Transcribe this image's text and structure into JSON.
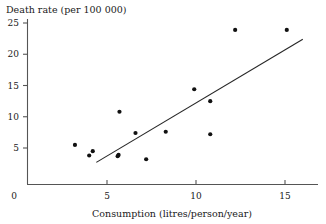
{
  "chart_data": {
    "type": "scatter",
    "title": "",
    "ylabel": "Death rate (per 100 000)",
    "xlabel": "Consumption (litres/person/year)",
    "xlim": [
      0,
      16.2
    ],
    "ylim": [
      0,
      26.5
    ],
    "xticks": [
      0,
      5,
      10,
      15
    ],
    "xtick_labels": [
      "0",
      "5",
      "10",
      "15"
    ],
    "yticks": [
      5,
      10,
      15,
      20,
      25
    ],
    "ytick_labels": [
      "5",
      "10",
      "15",
      "20",
      "25"
    ],
    "origin_label": "0",
    "grid": false,
    "legend": null,
    "points": [
      {
        "x": 3.2,
        "y": 5.5
      },
      {
        "x": 4.0,
        "y": 3.8
      },
      {
        "x": 4.2,
        "y": 4.5
      },
      {
        "x": 5.6,
        "y": 3.7
      },
      {
        "x": 5.65,
        "y": 3.9
      },
      {
        "x": 5.7,
        "y": 10.8
      },
      {
        "x": 6.6,
        "y": 7.4
      },
      {
        "x": 7.2,
        "y": 3.2
      },
      {
        "x": 8.3,
        "y": 7.6
      },
      {
        "x": 9.9,
        "y": 14.4
      },
      {
        "x": 10.8,
        "y": 12.5
      },
      {
        "x": 10.8,
        "y": 7.2
      },
      {
        "x": 12.2,
        "y": 23.9
      },
      {
        "x": 15.1,
        "y": 23.9
      }
    ],
    "trend_line": {
      "x_start": 4.4,
      "y_start": 2.7,
      "x_end": 16.0,
      "y_end": 22.4
    },
    "colors": {
      "point": "#111111",
      "line": "#262626",
      "axis": "#555555",
      "text": "#1a1a1a",
      "background": "#ffffff"
    }
  }
}
